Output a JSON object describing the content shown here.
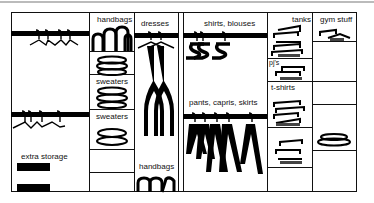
{
  "diagram": {
    "sections": {
      "left": {
        "label": "extra storage",
        "hanging_rods": 2,
        "storage_boxes": 2
      },
      "shelves_column": {
        "labels": [
          "handbags",
          "sweaters",
          "sweaters"
        ]
      },
      "dresses_column": {
        "labels": [
          "dresses",
          "handbags"
        ]
      },
      "center": {
        "labels": [
          "shirts, blouses",
          "pants, capris, skirts"
        ]
      },
      "tanks_column": {
        "labels": [
          "tanks",
          "pj's",
          "t-shirts"
        ]
      },
      "gym_column": {
        "labels": [
          "gym stuff"
        ]
      }
    },
    "colors": {
      "lines": "#111111",
      "rod": "#000000",
      "background": "#ffffff"
    }
  }
}
